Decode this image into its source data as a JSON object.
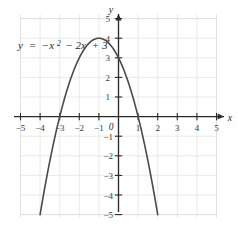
{
  "figure": {
    "equation_label": {
      "lhs": "y",
      "eq": "=",
      "term1": "−x",
      "term1_exp": "2",
      "term2": "− 2x",
      "term3": "+ 3",
      "full": "y = −x² − 2x + 3"
    },
    "x_axis_name": "x",
    "y_axis_name": "y",
    "origin_label": "0"
  },
  "chart_data": {
    "type": "line",
    "title": "",
    "subtitle": "",
    "xlabel": "x",
    "ylabel": "y",
    "xlim": [
      -5.6,
      5.6
    ],
    "ylim": [
      -5.4,
      5.4
    ],
    "grid": true,
    "grid_step": 1,
    "legend": "none",
    "annotations": [
      {
        "text": "y = −x² − 2x + 3",
        "x": -4.3,
        "y": 4.3
      }
    ],
    "x_ticks": [
      -5,
      -4,
      -3,
      -2,
      -1,
      0,
      1,
      2,
      3,
      4,
      5
    ],
    "x_tick_labels": [
      "−5",
      "−4",
      "−3",
      "−2",
      "−1",
      "0",
      "1",
      "2",
      "3",
      "4",
      "5"
    ],
    "y_ticks": [
      -5,
      -4,
      -3,
      -2,
      -1,
      0,
      1,
      2,
      3,
      4,
      5
    ],
    "y_tick_labels": [
      "−5",
      "−4",
      "−3",
      "−2",
      "−1",
      "0",
      "1",
      "2",
      "3",
      "4",
      "5"
    ],
    "series": [
      {
        "name": "y = -x^2 - 2x + 3",
        "expression": "y = -x^2 - 2x + 3",
        "color": "#4a4a4a",
        "vertex": [
          -1,
          4
        ],
        "x_intercepts": [
          -3,
          1
        ],
        "y_intercept": 3,
        "x": [
          -4.0,
          -3.75,
          -3.5,
          -3.25,
          -3.0,
          -2.75,
          -2.5,
          -2.25,
          -2.0,
          -1.75,
          -1.5,
          -1.25,
          -1.0,
          -0.75,
          -0.5,
          -0.25,
          0.0,
          0.25,
          0.5,
          0.75,
          1.0,
          1.25,
          1.5,
          1.75,
          2.0
        ],
        "y": [
          -5.0,
          -3.5625,
          -2.25,
          -1.0625,
          0.0,
          0.9375,
          1.75,
          2.4375,
          3.0,
          3.4375,
          3.75,
          3.9375,
          4.0,
          3.9375,
          3.75,
          3.4375,
          3.0,
          2.4375,
          1.75,
          0.9375,
          0.0,
          -1.0625,
          -2.25,
          -3.5625,
          -5.0
        ]
      }
    ]
  },
  "colors": {
    "curve": "#4a4a4a",
    "axis": "#2b2b2b",
    "grid": "#e3e3e3",
    "frame": "#e0e0e0",
    "background": "#ffffff"
  }
}
